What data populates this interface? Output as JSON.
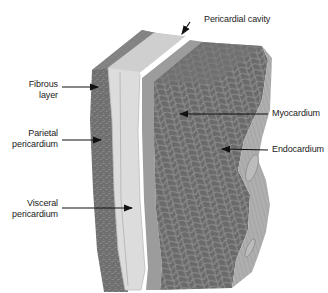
{
  "diagram": {
    "labels": {
      "pericardial_cavity": "Pericardial cavity",
      "fibrous_layer_line1": "Fibrous",
      "fibrous_layer_line2": "layer",
      "parietal_line1": "Parietal",
      "parietal_line2": "pericardium",
      "visceral_line1": "Visceral",
      "visceral_line2": "pericardium",
      "myocardium": "Myocardium",
      "endocardium": "Endocardium"
    },
    "colors": {
      "fibrous": "#6f6f6f",
      "fibrous_top": "#8a8a8a",
      "parietal": "#dcdcdc",
      "parietal_edge": "#bdbdbd",
      "visceral": "#9c9c9c",
      "myocardium": "#6a6a6a",
      "myocardium_mesh": "#8e8e8e",
      "endocardium": "#a8a8a8",
      "arrow": "#111111",
      "text": "#222222"
    }
  }
}
